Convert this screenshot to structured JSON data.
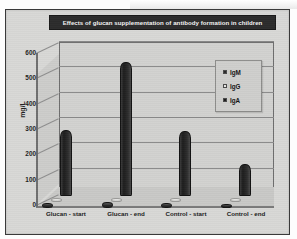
{
  "chart_data": {
    "type": "bar",
    "title": "Effects of glucan supplementation of antibody formation in children",
    "xlabel": "",
    "ylabel": "mg/L",
    "ylim": [
      0,
      600
    ],
    "yticks": [
      0,
      100,
      200,
      300,
      400,
      500,
      600
    ],
    "ytick_labels": [
      "0",
      "100",
      "200",
      "300",
      "400",
      "500",
      "600"
    ],
    "grid": true,
    "three_d": true,
    "legend_position": "inside-top-right",
    "categories": [
      "Glucan - start",
      "Glucan - end",
      "Control - start",
      "Control - end"
    ],
    "series": [
      {
        "name": "IgM",
        "color": "#2b2b2b",
        "values": [
          18,
          22,
          18,
          15
        ]
      },
      {
        "name": "IgG",
        "color": "#e0e0de",
        "values": [
          14,
          16,
          14,
          12
        ]
      },
      {
        "name": "IgA",
        "color": "#1d1d1d",
        "values": [
          260,
          530,
          255,
          125
        ]
      }
    ]
  },
  "legend": {
    "items": [
      {
        "label": "IgM",
        "swatch": "#2b2b2b"
      },
      {
        "label": "IgG",
        "swatch": "#e8e8e6"
      },
      {
        "label": "IgA",
        "swatch": "#1d1d1d"
      }
    ]
  }
}
